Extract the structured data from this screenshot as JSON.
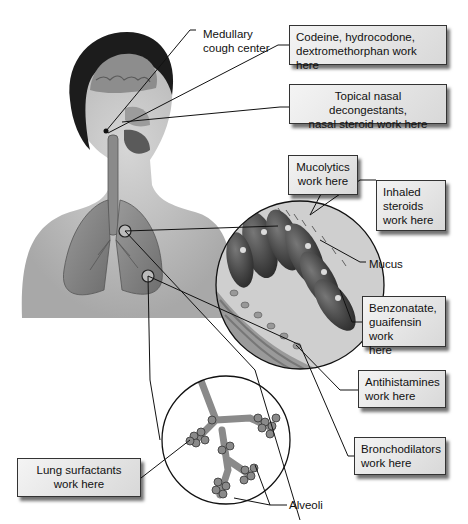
{
  "diagram": {
    "labels": {
      "medullary": [
        "Medullary",
        "cough center"
      ],
      "mucus": "Mucus",
      "alveoli": "Alveoli"
    },
    "boxes": {
      "codeine": [
        "Codeine, hydrocodone,",
        "dextromethorphan work here"
      ],
      "topical": [
        "Topical nasal decongestants,",
        "nasal steroid work here"
      ],
      "mucolytics": [
        "Mucolytics",
        "work here"
      ],
      "inhaled": [
        "Inhaled",
        "steroids",
        "work here"
      ],
      "benzonatate": [
        "Benzonatate,",
        "guaifensin work",
        "here"
      ],
      "antihistamines": [
        "Antihistamines",
        "work here"
      ],
      "bronchodilators": [
        "Bronchodilators",
        "work here"
      ],
      "surfactants": [
        "Lung surfactants",
        "work here"
      ]
    },
    "insets": [
      "bronchial-epithelium-magnified",
      "alveoli-magnified"
    ],
    "colors": {
      "box_fill": "#e2e2e2",
      "box_border": "#333333",
      "leader": "#111111"
    }
  }
}
